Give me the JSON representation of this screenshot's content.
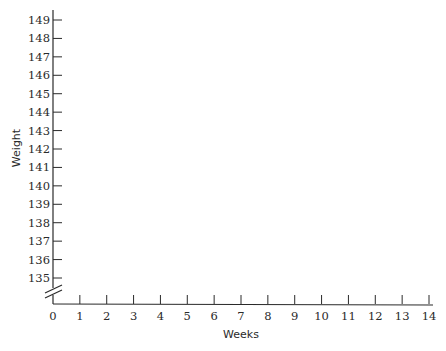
{
  "chart_data": {
    "type": "line",
    "title": "",
    "xlabel": "Weeks",
    "ylabel": "Weight",
    "x_ticks": [
      0,
      1,
      2,
      3,
      4,
      5,
      6,
      7,
      8,
      9,
      10,
      11,
      12,
      13,
      14
    ],
    "y_ticks": [
      135,
      136,
      137,
      138,
      139,
      140,
      141,
      142,
      143,
      144,
      145,
      146,
      147,
      148,
      149
    ],
    "xlim": [
      0,
      14
    ],
    "ylim": [
      135,
      149
    ],
    "y_axis_break": true,
    "grid": false,
    "legend": null,
    "series": []
  },
  "labels": {
    "xlabel": "Weeks",
    "ylabel": "Weight"
  }
}
